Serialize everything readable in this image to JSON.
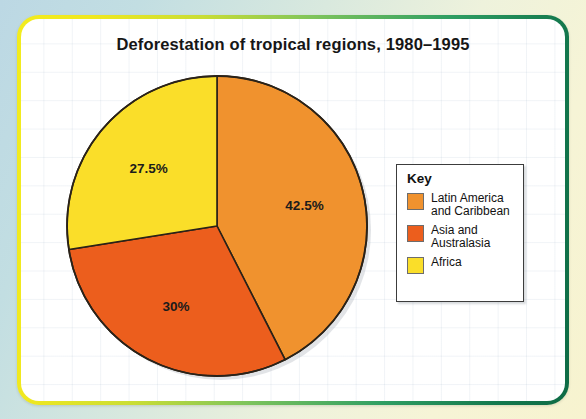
{
  "chart_data": {
    "type": "pie",
    "title": "Deforestation of tropical regions, 1980–1995",
    "categories": [
      "Latin America and Caribbean",
      "Asia and Australasia",
      "Africa"
    ],
    "values": [
      42.5,
      30,
      27.5
    ],
    "value_labels": [
      "42.5%",
      "30%",
      "27.5%"
    ],
    "colors": [
      "#F0922E",
      "#EC5E1D",
      "#FADE29"
    ],
    "legend": {
      "position": "right",
      "title": "Key",
      "entries": [
        {
          "label_line1": "Latin America",
          "label_line2": "and Caribbean",
          "color": "#F0922E"
        },
        {
          "label_line1": "Asia and",
          "label_line2": "Australasia",
          "color": "#EC5E1D"
        },
        {
          "label_line1": "Africa",
          "label_line2": "",
          "color": "#FADE29"
        }
      ]
    },
    "start_angle_deg": 0,
    "direction": "clockwise",
    "grid": true,
    "xlabel": "",
    "ylabel": ""
  },
  "frame": {
    "border_gradient_from": "#F2EC1F",
    "border_gradient_to": "#0E6B45",
    "card_background": "#FFFFFF"
  },
  "pie_geometry": {
    "slices": [
      {
        "name": "latin-america",
        "path": "M 152 152 L 152 2 A 150 150 0 0 1 220.1 285.7 Z",
        "color": "#F0922E",
        "label": "42.5%",
        "label_x": 213,
        "label_y": 152
      },
      {
        "name": "asia-australasia",
        "path": "M 152 152 L 220.1 285.7 A 150 150 0 0 1 2.9 128.8 Z",
        "color": "#EC5E1D",
        "label": "30%",
        "label_x": 113,
        "label_y": 250
      },
      {
        "name": "africa",
        "path": "M 152 152 L 2.9 128.8 A 150 150 0 0 1 152 2 Z",
        "color": "#FADE29",
        "label": "27.5%",
        "label_x": 95,
        "label_y": 113
      }
    ],
    "outline_color": "#2a2218"
  }
}
